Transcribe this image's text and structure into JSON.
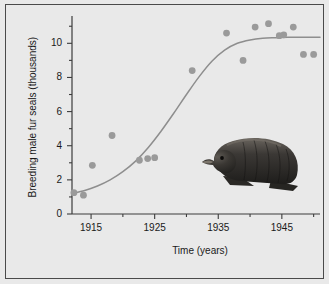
{
  "figure": {
    "background_color": "#e9e9e9",
    "border_color": "#4a4a4a",
    "axis_color": "#3c3c3c",
    "point_color": "#9a9a9a",
    "curve_color": "#8e8e8e",
    "text_color": "#1a1a1a",
    "seal_body_color": "#2b2a28",
    "seal_highlight_color": "#6b6660"
  },
  "chart_data": {
    "type": "scatter",
    "title": "",
    "xlabel": "Time (years)",
    "ylabel": "Breeding male fur seals (thousands)",
    "xlim": [
      1912,
      1951
    ],
    "ylim": [
      0,
      11.6
    ],
    "grid": false,
    "legend": null,
    "xticks_major": [
      1915,
      1925,
      1935,
      1945
    ],
    "xticklabels": [
      "1915",
      "1925",
      "1935",
      "1945"
    ],
    "xticks_minor": [
      1920,
      1930,
      1940,
      1950
    ],
    "yticks_major": [
      0,
      2,
      4,
      6,
      8,
      10
    ],
    "yticklabels": [
      "0",
      "2",
      "4",
      "6",
      "8",
      "10"
    ],
    "yticks_minor": [
      1,
      3,
      5,
      7,
      9,
      11
    ],
    "series": [
      {
        "name": "Breeding male fur seals",
        "type": "scatter",
        "marker": "circle",
        "x": [
          1912.3,
          1913.8,
          1915.2,
          1918.3,
          1922.6,
          1923.9,
          1925.0,
          1930.9,
          1936.3,
          1938.9,
          1940.8,
          1942.9,
          1944.6,
          1945.3,
          1946.8,
          1948.4,
          1950.0
        ],
        "y": [
          1.25,
          1.1,
          2.85,
          4.6,
          3.15,
          3.25,
          3.3,
          8.4,
          10.6,
          9.0,
          10.95,
          11.15,
          10.45,
          10.5,
          10.95,
          9.35,
          9.35
        ]
      },
      {
        "name": "Fitted logistic curve",
        "type": "line",
        "x": [
          1912,
          1914,
          1916,
          1918,
          1920,
          1922,
          1924,
          1926,
          1928,
          1930,
          1932,
          1934,
          1936,
          1938,
          1940,
          1942,
          1944,
          1946,
          1948,
          1950,
          1951
        ],
        "y": [
          1.2,
          1.38,
          1.64,
          2.0,
          2.48,
          3.1,
          3.9,
          4.85,
          5.9,
          7.0,
          8.05,
          8.95,
          9.6,
          10.0,
          10.2,
          10.3,
          10.33,
          10.35,
          10.35,
          10.35,
          10.35
        ]
      }
    ],
    "annotations": [
      {
        "name": "fur-seal-illustration",
        "description": "Illustration of a dark fur seal facing left",
        "x_range": [
          1935,
          1948
        ],
        "y_range": [
          1.0,
          5.0
        ]
      }
    ]
  }
}
